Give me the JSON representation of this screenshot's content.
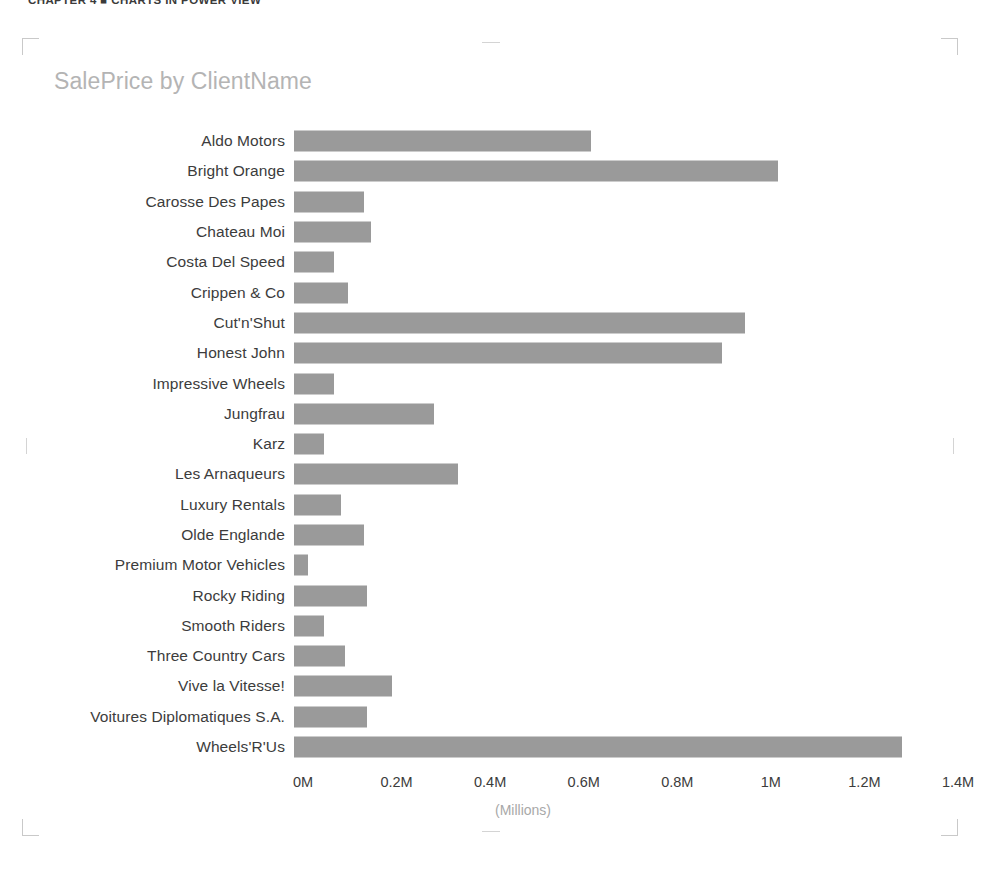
{
  "running_head": "CHAPTER 4 ■ CHARTS IN POWER VIEW",
  "visual": {
    "title": "SalePrice by ClientName",
    "axis_unit_label": "(Millions)"
  },
  "chart_data": {
    "type": "bar",
    "orientation": "horizontal",
    "title": "SalePrice by ClientName",
    "xlabel": "(Millions)",
    "ylabel": "",
    "xlim": [
      0,
      1.4
    ],
    "grid": false,
    "legend": false,
    "bar_color": "#9a9a9a",
    "tick_labels": [
      "0M",
      "0.2M",
      "0.4M",
      "0.6M",
      "0.8M",
      "1M",
      "1.2M",
      "1.4M"
    ],
    "tick_values": [
      0,
      0.2,
      0.4,
      0.6,
      0.8,
      1.0,
      1.2,
      1.4
    ],
    "categories": [
      "Aldo Motors",
      "Bright Orange",
      "Carosse Des Papes",
      "Chateau Moi",
      "Costa Del Speed",
      "Crippen & Co",
      "Cut'n'Shut",
      "Honest John",
      "Impressive Wheels",
      "Jungfrau",
      "Karz",
      "Les Arnaqueurs",
      "Luxury Rentals",
      "Olde Englande",
      "Premium Motor Vehicles",
      "Rocky Riding",
      "Smooth Riders",
      "Three Country Cars",
      "Vive la Vitesse!",
      "Voitures Diplomatiques S.A.",
      "Wheels'R'Us"
    ],
    "values": [
      0.635,
      1.035,
      0.15,
      0.165,
      0.085,
      0.115,
      0.965,
      0.915,
      0.085,
      0.3,
      0.065,
      0.35,
      0.1,
      0.15,
      0.03,
      0.155,
      0.065,
      0.11,
      0.21,
      0.155,
      1.3
    ]
  }
}
